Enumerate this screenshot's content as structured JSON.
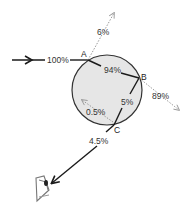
{
  "diagram": {
    "type": "light path through a raindrop",
    "colors": {
      "drop_fill": "#e6e6e6",
      "drop_stroke": "#333333",
      "solid_ray": "#1a1a1a",
      "dotted_ray": "#999999",
      "text": "#333333"
    },
    "points": {
      "A": "A",
      "B": "B",
      "C": "C"
    },
    "rays": {
      "incoming": "100%",
      "reflected_at_A": "6%",
      "refracted_inside_A_to_B": "94%",
      "transmitted_at_B": "89%",
      "reflected_inside_B_to_C": "5%",
      "reflected_at_C": "0.5%",
      "exit_to_eye": "4.5%"
    },
    "observer": "eye"
  }
}
